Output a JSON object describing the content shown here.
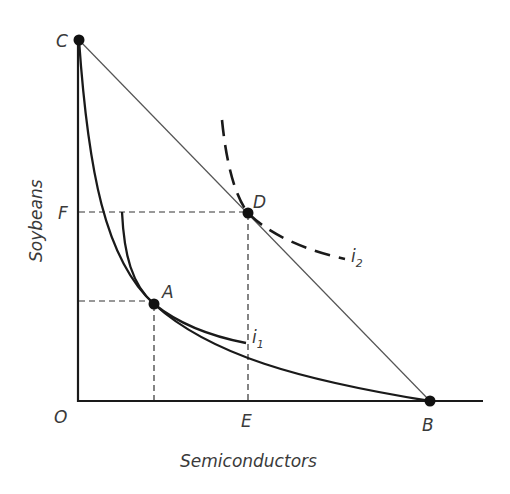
{
  "diagram": {
    "type": "production-possibility-frontier-with-indifference-curves",
    "axes": {
      "x_label": "Semiconductors",
      "y_label": "Soybeans",
      "origin_label": "O"
    },
    "points": {
      "C": "C",
      "D": "D",
      "A": "A",
      "B": "B",
      "E": "E",
      "F": "F",
      "O": "O"
    },
    "curves": {
      "i1": {
        "base": "i",
        "subscript": "1",
        "style": "solid"
      },
      "i2": {
        "base": "i",
        "subscript": "2",
        "style": "dashed"
      },
      "ppf": {
        "style": "solid",
        "shape": "convex-to-origin"
      },
      "trade_line": {
        "from": "C",
        "to": "B",
        "style": "thin-solid"
      }
    },
    "colors": {
      "line": "#1a1a1a",
      "thin_line": "#555555",
      "text": "#3a3a3a",
      "background": "#ffffff"
    }
  }
}
